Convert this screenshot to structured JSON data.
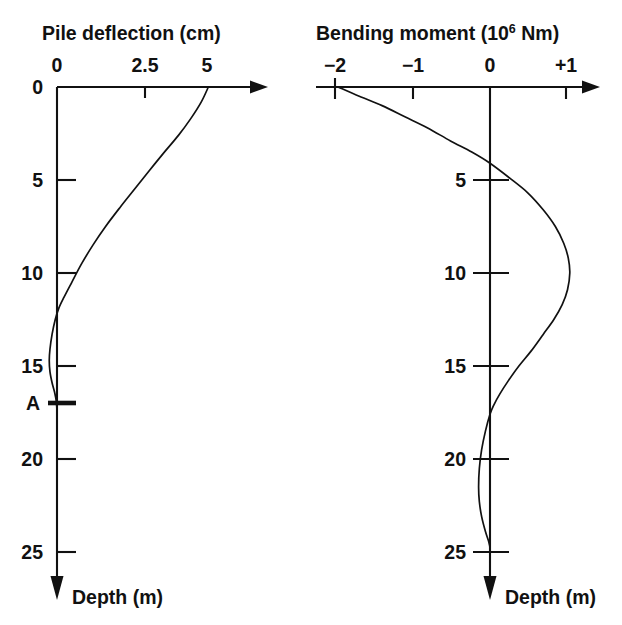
{
  "figure": {
    "name": "pile-deflection-bending-moment",
    "background_color": "#ffffff",
    "line_color": "#111111"
  },
  "left_chart": {
    "title": "Pile deflection (cm)",
    "x_tick_labels": [
      "0",
      "2.5",
      "5"
    ],
    "depth_tick_labels": [
      "0",
      "5",
      "10",
      "15",
      "A",
      "20",
      "25"
    ],
    "depth_caption": "Depth (m)",
    "origin_label": "0",
    "marker_label": "A"
  },
  "right_chart": {
    "title_prefix": "Bending moment (10",
    "title_superscript": "6",
    "title_suffix": " Nm)",
    "title_full": "Bending moment (10⁶ Nm)",
    "x_tick_labels": [
      "−2",
      "−1",
      "0",
      "+1"
    ],
    "depth_tick_labels": [
      "5",
      "10",
      "15",
      "20",
      "25"
    ],
    "depth_caption": "Depth (m)"
  },
  "chart_data": [
    {
      "type": "line",
      "id": "pile-deflection",
      "title": "Pile deflection (cm)",
      "xlabel": "Pile deflection (cm)",
      "ylabel": "Depth (m)",
      "xlim": [
        0,
        5.6
      ],
      "ylim": [
        0,
        26.5
      ],
      "y_inverted": true,
      "grid": false,
      "legend": null,
      "x_ticks": [
        0,
        2.5,
        5
      ],
      "x_tick_labels": [
        "0",
        "2.5",
        "5"
      ],
      "y_ticks": [
        0,
        5,
        10,
        15,
        17.5,
        20,
        25
      ],
      "y_tick_labels": [
        "0",
        "5",
        "10",
        "15",
        "A",
        "20",
        "25"
      ],
      "annotations": [
        {
          "text": "A",
          "depth": 17.5,
          "note": "bold marker tick on depth axis"
        }
      ],
      "series": [
        {
          "name": "Pile deflection",
          "x": [
            4.3,
            4.1,
            3.8,
            3.45,
            3.05,
            2.62,
            2.2,
            1.78,
            1.38,
            1.02,
            0.7,
            0.42,
            0.2,
            0.05,
            -0.05,
            -0.14,
            -0.2,
            -0.22,
            -0.2,
            -0.14,
            -0.07,
            -0.02,
            0.0,
            0.0,
            0.0,
            0.0,
            0.0
          ],
          "y": [
            0,
            0.8,
            1.7,
            2.6,
            3.5,
            4.5,
            5.5,
            6.5,
            7.5,
            8.5,
            9.5,
            10.5,
            11.3,
            11.9,
            12.5,
            13.3,
            14.1,
            14.7,
            15.3,
            15.9,
            16.4,
            16.9,
            17.5,
            19,
            21,
            23,
            25.5
          ]
        }
      ]
    },
    {
      "type": "line",
      "id": "bending-moment",
      "title": "Bending moment (10⁶ Nm)",
      "xlabel": "Bending moment (10⁶ Nm)",
      "ylabel": "Depth (m)",
      "xlim": [
        -2.25,
        1.55
      ],
      "ylim": [
        0,
        26.5
      ],
      "y_inverted": true,
      "grid": false,
      "legend": null,
      "x_ticks": [
        -2,
        -1,
        0,
        1
      ],
      "x_tick_labels": [
        "−2",
        "−1",
        "0",
        "+1"
      ],
      "y_ticks": [
        5,
        10,
        15,
        20,
        25
      ],
      "y_tick_labels": [
        "5",
        "10",
        "15",
        "20",
        "25"
      ],
      "series": [
        {
          "name": "Bending moment",
          "x": [
            -2.0,
            -1.72,
            -1.42,
            -1.12,
            -0.82,
            -0.52,
            -0.24,
            0.0,
            0.26,
            0.5,
            0.7,
            0.86,
            0.97,
            1.03,
            1.05,
            1.02,
            0.95,
            0.84,
            0.7,
            0.54,
            0.38,
            0.24,
            0.13,
            0.05,
            0.0,
            -0.06,
            -0.11,
            -0.14,
            -0.15,
            -0.14,
            -0.11,
            -0.06,
            -0.02,
            0.0,
            0.0
          ],
          "y": [
            0,
            0.5,
            1.0,
            1.6,
            2.2,
            2.9,
            3.5,
            4.1,
            4.9,
            5.7,
            6.6,
            7.5,
            8.4,
            9.2,
            10.0,
            10.9,
            11.7,
            12.5,
            13.3,
            14.2,
            15.0,
            15.8,
            16.5,
            17.1,
            17.6,
            18.5,
            19.5,
            20.5,
            21.5,
            22.3,
            23.1,
            23.9,
            24.4,
            24.8,
            25.5
          ]
        }
      ]
    }
  ]
}
